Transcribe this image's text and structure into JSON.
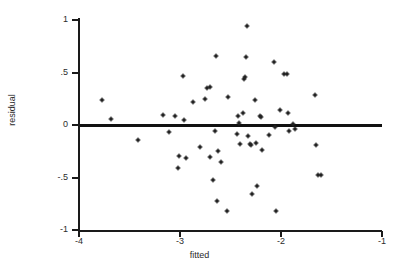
{
  "chart_data": {
    "type": "scatter",
    "title": "",
    "xlabel": "fitted",
    "ylabel": "residual",
    "xlim": [
      -4,
      -1
    ],
    "ylim": [
      -1,
      1
    ],
    "xticks": [
      -4,
      -3,
      -2,
      -1
    ],
    "xticklabels": [
      "-4",
      "-3",
      "-2",
      "-1"
    ],
    "yticks": [
      1,
      0.5,
      0,
      -0.5,
      -1
    ],
    "yticklabels": [
      "1",
      ".5",
      "0",
      "-.5",
      "-1"
    ],
    "grid": false,
    "legend": null,
    "annotations": [
      {
        "kind": "reference-line",
        "orientation": "horizontal",
        "y": 0
      }
    ],
    "marker_color": "#222222",
    "axis_color": "#1a1a1a",
    "points": [
      {
        "x": -3.77,
        "y": 0.235
      },
      {
        "x": -3.68,
        "y": 0.055
      },
      {
        "x": -3.42,
        "y": -0.145
      },
      {
        "x": -3.17,
        "y": 0.095
      },
      {
        "x": -3.11,
        "y": -0.07
      },
      {
        "x": -3.05,
        "y": 0.085
      },
      {
        "x": -3.01,
        "y": -0.295
      },
      {
        "x": -3.02,
        "y": -0.41
      },
      {
        "x": -2.97,
        "y": 0.465
      },
      {
        "x": -2.96,
        "y": 0.045
      },
      {
        "x": -2.94,
        "y": -0.31
      },
      {
        "x": -2.87,
        "y": 0.22
      },
      {
        "x": -2.8,
        "y": -0.205
      },
      {
        "x": -2.75,
        "y": 0.245
      },
      {
        "x": -2.73,
        "y": 0.355
      },
      {
        "x": -2.7,
        "y": 0.36
      },
      {
        "x": -2.7,
        "y": -0.3
      },
      {
        "x": -2.67,
        "y": -0.52
      },
      {
        "x": -2.65,
        "y": -0.06
      },
      {
        "x": -2.64,
        "y": 0.655
      },
      {
        "x": -2.63,
        "y": -0.725
      },
      {
        "x": -2.62,
        "y": -0.245
      },
      {
        "x": -2.59,
        "y": -0.355
      },
      {
        "x": -2.53,
        "y": -0.815
      },
      {
        "x": -2.52,
        "y": 0.27
      },
      {
        "x": -2.44,
        "y": -0.085
      },
      {
        "x": -2.43,
        "y": 0.09
      },
      {
        "x": -2.42,
        "y": 0.02
      },
      {
        "x": -2.41,
        "y": -0.185
      },
      {
        "x": -2.38,
        "y": 0.115
      },
      {
        "x": -2.37,
        "y": 0.435
      },
      {
        "x": -2.36,
        "y": 0.46
      },
      {
        "x": -2.35,
        "y": 0.645
      },
      {
        "x": -2.34,
        "y": 0.945
      },
      {
        "x": -2.33,
        "y": -0.1
      },
      {
        "x": -2.31,
        "y": -0.185
      },
      {
        "x": -2.3,
        "y": -0.195
      },
      {
        "x": -2.29,
        "y": -0.655
      },
      {
        "x": -2.26,
        "y": 0.235
      },
      {
        "x": -2.25,
        "y": -0.17
      },
      {
        "x": -2.24,
        "y": -0.585
      },
      {
        "x": -2.21,
        "y": 0.09
      },
      {
        "x": -2.2,
        "y": 0.075
      },
      {
        "x": -2.19,
        "y": -0.24
      },
      {
        "x": -2.12,
        "y": -0.095
      },
      {
        "x": -2.07,
        "y": 0.6
      },
      {
        "x": -2.06,
        "y": -0.02
      },
      {
        "x": -2.05,
        "y": -0.815
      },
      {
        "x": -2.01,
        "y": 0.14
      },
      {
        "x": -1.97,
        "y": 0.485
      },
      {
        "x": -1.94,
        "y": 0.485
      },
      {
        "x": -1.93,
        "y": 0.115
      },
      {
        "x": -1.92,
        "y": -0.055
      },
      {
        "x": -1.88,
        "y": 0.01
      },
      {
        "x": -1.86,
        "y": -0.04
      },
      {
        "x": -1.66,
        "y": 0.285
      },
      {
        "x": -1.65,
        "y": -0.19
      },
      {
        "x": -1.63,
        "y": -0.475
      },
      {
        "x": -1.6,
        "y": -0.475
      }
    ]
  }
}
